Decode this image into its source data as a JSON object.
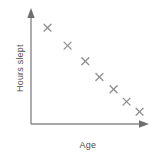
{
  "chart_data": {
    "type": "scatter",
    "title": "",
    "xlabel": "Age",
    "ylabel": "Hours slept",
    "grid": false,
    "legend": null,
    "axes_style": "arrow-axes",
    "axis_ticks": false,
    "relationship": "negative correlation",
    "xlim": [
      0,
      10
    ],
    "ylim": [
      0,
      10
    ],
    "marker": "x",
    "marker_color": "#8f8f8f",
    "axis_color": "#8a8a8a",
    "text_color": "#4d4d4d",
    "background_color": "#ffffff",
    "n_points": 7,
    "x": [
      1.4,
      3.1,
      4.6,
      5.8,
      7.0,
      8.1,
      9.2
    ],
    "y": [
      8.6,
      7.0,
      5.6,
      4.2,
      3.1,
      2.0,
      1.1
    ],
    "points": [
      {
        "x": 1.4,
        "y": 8.6
      },
      {
        "x": 3.1,
        "y": 7.0
      },
      {
        "x": 4.6,
        "y": 5.6
      },
      {
        "x": 5.8,
        "y": 4.2
      },
      {
        "x": 7.0,
        "y": 3.1
      },
      {
        "x": 8.1,
        "y": 2.0
      },
      {
        "x": 9.2,
        "y": 1.1
      }
    ]
  },
  "labels": {
    "y_axis": "Hours slept",
    "x_axis": "Age"
  }
}
